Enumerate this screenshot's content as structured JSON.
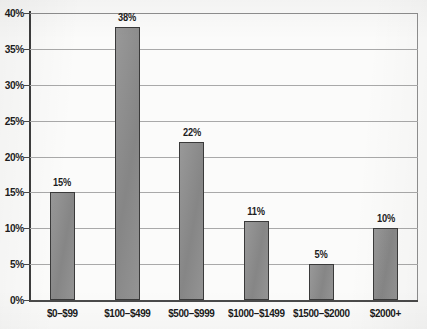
{
  "chart_data": {
    "type": "bar",
    "title": "",
    "subtitle": "",
    "xlabel": "",
    "ylabel": "",
    "categories": [
      "$0–$99",
      "$100–$499",
      "$500–$999",
      "$1000–$1499",
      "$1500–$2000",
      "$2000+"
    ],
    "values": [
      15,
      38,
      22,
      11,
      5,
      10
    ],
    "value_labels": [
      "15%",
      "38%",
      "22%",
      "11%",
      "5%",
      "10%"
    ],
    "ylim": [
      0,
      40
    ],
    "ytick_step": 5,
    "ytick_labels": [
      "40%",
      "35%",
      "30%",
      "25%",
      "20%",
      "15%",
      "10%",
      "5%",
      "0%"
    ],
    "ytick_values": [
      40,
      35,
      30,
      25,
      20,
      15,
      10,
      5,
      0
    ],
    "grid": true,
    "grid_axis": "y",
    "legend": false,
    "legend_position": "none",
    "series": [
      {
        "name": "Percent of respondents",
        "values": [
          15,
          38,
          22,
          11,
          5,
          10
        ]
      }
    ],
    "colors": {
      "bar_fill": "#8d8d8d",
      "bar_border": "#3a3a3a",
      "axis": "#3d3d3d",
      "grid": "#a9a9a9",
      "text": "#1a1a1a",
      "background": "#fbfbfa"
    }
  }
}
